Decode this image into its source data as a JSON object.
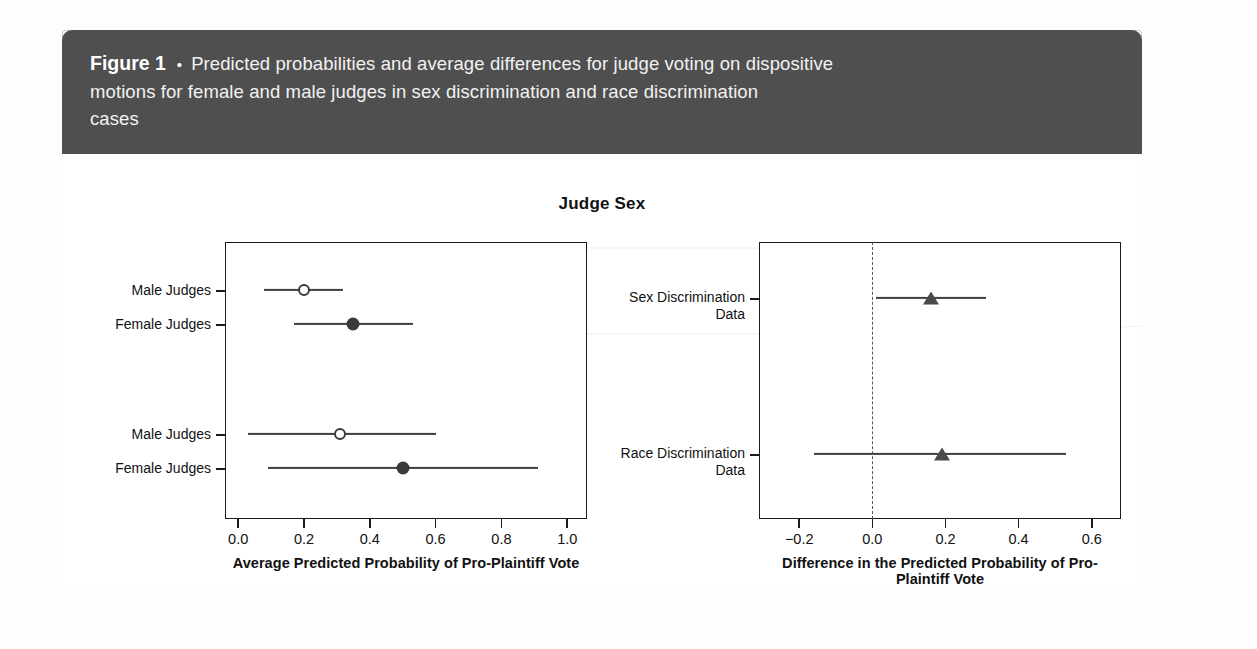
{
  "figure": {
    "label": "Figure 1",
    "bullet": "•",
    "caption_line_1": "Predicted probabilities and average differences for judge voting on dispositive",
    "caption_line_2": "motions for female and male judges in sex discrimination and race discrimination",
    "caption_line_3": "cases"
  },
  "chart_data": {
    "type": "scatter",
    "title": "Judge Sex",
    "panels": [
      {
        "id": "predicted-probability",
        "xlabel": "Average Predicted Probability of Pro-Plaintiff Vote",
        "xlim": [
          -0.04,
          1.06
        ],
        "xticks": [
          0.0,
          0.2,
          0.4,
          0.6,
          0.8,
          1.0
        ],
        "xtick_labels": [
          "0.0",
          "0.2",
          "0.4",
          "0.6",
          "0.8",
          "1.0"
        ],
        "grid": false,
        "zero_line": false,
        "points": [
          {
            "label": "Male Judges",
            "group": "Sex Discrimination Data",
            "estimate": 0.2,
            "ci_low": 0.08,
            "ci_high": 0.32,
            "marker": "open-circle"
          },
          {
            "label": "Female Judges",
            "group": "Sex Discrimination Data",
            "estimate": 0.35,
            "ci_low": 0.17,
            "ci_high": 0.53,
            "marker": "filled-circle"
          },
          {
            "label": "Male Judges",
            "group": "Race Discrimination Data",
            "estimate": 0.31,
            "ci_low": 0.03,
            "ci_high": 0.6,
            "marker": "open-circle"
          },
          {
            "label": "Female Judges",
            "group": "Race Discrimination Data",
            "estimate": 0.5,
            "ci_low": 0.09,
            "ci_high": 0.91,
            "marker": "filled-circle"
          }
        ]
      },
      {
        "id": "difference",
        "xlabel": "Difference in the Predicted Probability of Pro-Plaintiff Vote",
        "xlim": [
          -0.31,
          0.68
        ],
        "xticks": [
          -0.2,
          0.0,
          0.2,
          0.4,
          0.6
        ],
        "xtick_labels": [
          "−0.2",
          "0.0",
          "0.2",
          "0.4",
          "0.6"
        ],
        "grid": false,
        "zero_line": true,
        "zero_line_value": 0.0,
        "points": [
          {
            "label": "Sex Discrimination Data",
            "label_line_1": "Sex Discrimination",
            "label_line_2": "Data",
            "estimate": 0.16,
            "ci_low": 0.01,
            "ci_high": 0.31,
            "marker": "filled-triangle"
          },
          {
            "label": "Race Discrimination Data",
            "label_line_1": "Race Discrimination",
            "label_line_2": "Data",
            "estimate": 0.19,
            "ci_low": -0.16,
            "ci_high": 0.53,
            "marker": "filled-triangle"
          }
        ]
      }
    ]
  },
  "colors": {
    "banner_background": "#4f4f4f",
    "banner_text": "#ffffff",
    "axis": "#1a1a1a",
    "marker": "#3a3a3a",
    "ci_line": "#3f3f3f",
    "frame_border": "#c9c9c9"
  }
}
